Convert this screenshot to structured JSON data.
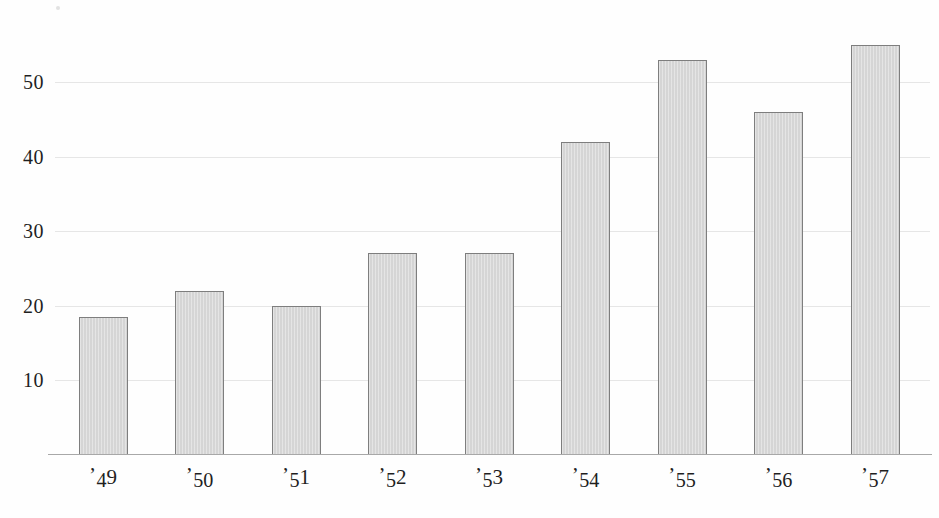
{
  "chart_data": {
    "type": "bar",
    "title": "",
    "subtitle": "",
    "xlabel": "",
    "ylabel": "",
    "categories": [
      "’49",
      "’50",
      "’51",
      "’52",
      "’53",
      "’54",
      "’55",
      "’56",
      "’57"
    ],
    "values": [
      18.5,
      22,
      20,
      27,
      27,
      42,
      53,
      46,
      55
    ],
    "ylim": [
      0,
      58
    ],
    "yticks": [
      10,
      20,
      30,
      40,
      50
    ],
    "ytick_labels": [
      "10",
      "20",
      "30",
      "40",
      "50"
    ],
    "grid": true,
    "grid_axis": "y",
    "legend": null,
    "annotations": [],
    "colors": {
      "bar_fill": "#d8d8d8",
      "bar_stroke": "#7e7e7e",
      "gridline": "#e6e6e6",
      "axis": "#a8a8a8",
      "text": "#1f1f1f",
      "background": "#fefefe"
    }
  },
  "axis": {
    "y_ticks": [
      {
        "label": "10",
        "value": 10
      },
      {
        "label": "20",
        "value": 20
      },
      {
        "label": "30",
        "value": 30
      },
      {
        "label": "40",
        "value": 40
      },
      {
        "label": "50",
        "value": 50
      }
    ],
    "x_ticks": [
      {
        "label": "’49",
        "apostrophe": "’",
        "digits": "49"
      },
      {
        "label": "’50",
        "apostrophe": "’",
        "digits": "50"
      },
      {
        "label": "’51",
        "apostrophe": "’",
        "digits": "51"
      },
      {
        "label": "’52",
        "apostrophe": "’",
        "digits": "52"
      },
      {
        "label": "’53",
        "apostrophe": "’",
        "digits": "53"
      },
      {
        "label": "’54",
        "apostrophe": "’",
        "digits": "54"
      },
      {
        "label": "’55",
        "apostrophe": "’",
        "digits": "55"
      },
      {
        "label": "’56",
        "apostrophe": "’",
        "digits": "56"
      },
      {
        "label": "’57",
        "apostrophe": "’",
        "digits": "57"
      }
    ]
  }
}
